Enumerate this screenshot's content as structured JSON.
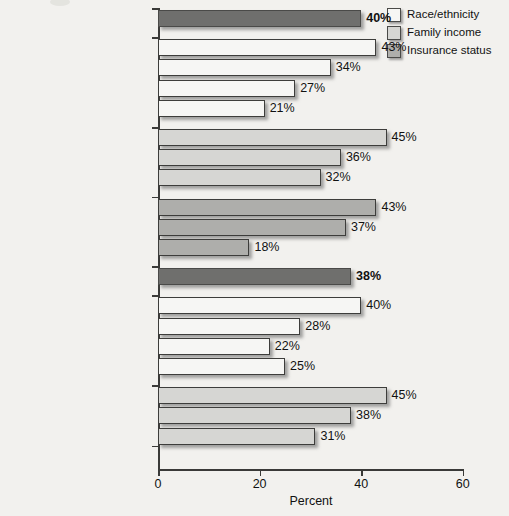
{
  "chart_data": {
    "type": "bar",
    "orientation": "horizontal",
    "title": "",
    "xlabel": "Percent",
    "ylabel": "",
    "xlim": [
      0,
      60
    ],
    "xticks": [
      0,
      20,
      40,
      60
    ],
    "xtick_labels": [
      "0",
      "20",
      "40",
      "60"
    ],
    "grid": false,
    "legend_position": "top-right",
    "legend": [
      {
        "label": "Race/ethnicity",
        "color": "#f6f6f4"
      },
      {
        "label": "Family income",
        "color": "#d6d6d3"
      },
      {
        "label": "Insurance status",
        "color": "#aeaeab"
      }
    ],
    "groups": [
      {
        "name": "national-average-50-64",
        "series": "national-average",
        "bars": [
          {
            "label": "National average, adults age 50–64",
            "value": 40,
            "value_label": "40%",
            "color": "#6f6f6d",
            "bold": true
          }
        ]
      },
      {
        "name": "race-ethnicity-50-64",
        "series": "Race/ethnicity",
        "bars": [
          {
            "label": "White",
            "value": 43,
            "value_label": "43%",
            "color": "#f6f6f4",
            "bold": false
          },
          {
            "label": "Black",
            "value": 34,
            "value_label": "34%",
            "color": "#f6f6f4",
            "bold": false
          },
          {
            "label": "Hispanic",
            "value": 27,
            "value_label": "27%",
            "color": "#f6f6f4",
            "bold": false
          },
          {
            "label": "Other",
            "value": 21,
            "value_label": "21%",
            "color": "#f6f6f4",
            "bold": false
          }
        ]
      },
      {
        "name": "family-income-50-64",
        "series": "Family income",
        "bars": [
          {
            "label": "400% of poverty or higher",
            "value": 45,
            "value_label": "45%",
            "color": "#d6d6d3",
            "bold": false
          },
          {
            "label": "200%–399% of poverty",
            "value": 36,
            "value_label": "36%",
            "color": "#d6d6d3",
            "bold": false
          },
          {
            "label": "Less than 200% of poverty",
            "value": 32,
            "value_label": "32%",
            "color": "#d6d6d3",
            "bold": false
          }
        ]
      },
      {
        "name": "insurance-status-50-64",
        "series": "Insurance status",
        "bars": [
          {
            "label": "Insured all year",
            "value": 43,
            "value_label": "43%",
            "color": "#aeaeab",
            "bold": false
          },
          {
            "label": "Uninsured part year",
            "value": 37,
            "value_label": "37%",
            "color": "#aeaeab",
            "bold": false
          },
          {
            "label": "Uninsured all year",
            "value": 18,
            "value_label": "18%",
            "color": "#aeaeab",
            "bold": false
          }
        ]
      },
      {
        "name": "national-average-65-over",
        "series": "national-average",
        "bars": [
          {
            "label": "National average, adults 65 and over",
            "value": 38,
            "value_label": "38%",
            "color": "#6f6f6d",
            "bold": true
          }
        ]
      },
      {
        "name": "race-ethnicity-65-over",
        "series": "Race/ethnicity",
        "bars": [
          {
            "label": "White",
            "value": 40,
            "value_label": "40%",
            "color": "#f6f6f4",
            "bold": false
          },
          {
            "label": "Black",
            "value": 28,
            "value_label": "28%",
            "color": "#f6f6f4",
            "bold": false
          },
          {
            "label": "Hispanic",
            "value": 22,
            "value_label": "22%",
            "color": "#f6f6f4",
            "bold": false
          },
          {
            "label": "Other",
            "value": 25,
            "value_label": "25%",
            "color": "#f6f6f4",
            "bold": false
          }
        ]
      },
      {
        "name": "family-income-65-over",
        "series": "Family income",
        "bars": [
          {
            "label": "400% of poverty or higher",
            "value": 45,
            "value_label": "45%",
            "color": "#d6d6d3",
            "bold": false
          },
          {
            "label": "200%–399% of poverty",
            "value": 38,
            "value_label": "38%",
            "color": "#d6d6d3",
            "bold": false
          },
          {
            "label": "Less than 200% of poverty",
            "value": 31,
            "value_label": "31%",
            "color": "#d6d6d3",
            "bold": false
          }
        ]
      }
    ]
  },
  "labels": {
    "national_average_50_64_line1": "National average,",
    "national_average_50_64_line2": "adults age 50–64",
    "national_average_65_line1": "National average,",
    "national_average_65_line2": "adults 65 and over"
  }
}
